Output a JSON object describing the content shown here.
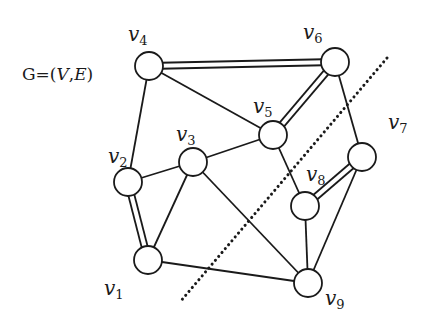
{
  "title": {
    "prefix": "G=(",
    "V": "V",
    "comma": ",",
    "E": "E",
    "suffix": ")"
  },
  "colors": {
    "stroke": "#1a1a1a",
    "node_fill": "#ffffff",
    "background": "#ffffff"
  },
  "nodes": [
    {
      "id": "v1",
      "base": "v",
      "sub": "1",
      "x": 148,
      "y": 260,
      "label_x": 104,
      "label_y": 278
    },
    {
      "id": "v2",
      "base": "v",
      "sub": "2",
      "x": 128,
      "y": 182,
      "label_x": 108,
      "label_y": 146
    },
    {
      "id": "v3",
      "base": "v",
      "sub": "3",
      "x": 193,
      "y": 162,
      "label_x": 176,
      "label_y": 124
    },
    {
      "id": "v4",
      "base": "v",
      "sub": "4",
      "x": 149,
      "y": 66,
      "label_x": 128,
      "label_y": 24
    },
    {
      "id": "v5",
      "base": "v",
      "sub": "5",
      "x": 273,
      "y": 135,
      "label_x": 253,
      "label_y": 96
    },
    {
      "id": "v6",
      "base": "v",
      "sub": "6",
      "x": 335,
      "y": 62,
      "label_x": 303,
      "label_y": 22
    },
    {
      "id": "v7",
      "base": "v",
      "sub": "7",
      "x": 362,
      "y": 157,
      "label_x": 388,
      "label_y": 112
    },
    {
      "id": "v8",
      "base": "v",
      "sub": "8",
      "x": 305,
      "y": 206,
      "label_x": 306,
      "label_y": 164
    },
    {
      "id": "v9",
      "base": "v",
      "sub": "9",
      "x": 308,
      "y": 283,
      "label_x": 325,
      "label_y": 288
    }
  ],
  "node_radius": 14,
  "edges": [
    {
      "from": "v4",
      "to": "v6",
      "double": true
    },
    {
      "from": "v4",
      "to": "v5",
      "double": false
    },
    {
      "from": "v4",
      "to": "v2",
      "double": false
    },
    {
      "from": "v6",
      "to": "v5",
      "double": true
    },
    {
      "from": "v6",
      "to": "v7",
      "double": false
    },
    {
      "from": "v5",
      "to": "v3",
      "double": false
    },
    {
      "from": "v5",
      "to": "v8",
      "double": false
    },
    {
      "from": "v3",
      "to": "v2",
      "double": false
    },
    {
      "from": "v3",
      "to": "v1",
      "double": false
    },
    {
      "from": "v3",
      "to": "v9",
      "double": false
    },
    {
      "from": "v2",
      "to": "v1",
      "double": true
    },
    {
      "from": "v1",
      "to": "v9",
      "double": false
    },
    {
      "from": "v8",
      "to": "v7",
      "double": true
    },
    {
      "from": "v8",
      "to": "v9",
      "double": false
    },
    {
      "from": "v7",
      "to": "v9",
      "double": false
    }
  ],
  "cut_line": {
    "x1": 387,
    "y1": 58,
    "x2": 180,
    "y2": 302,
    "style": "dotted"
  }
}
